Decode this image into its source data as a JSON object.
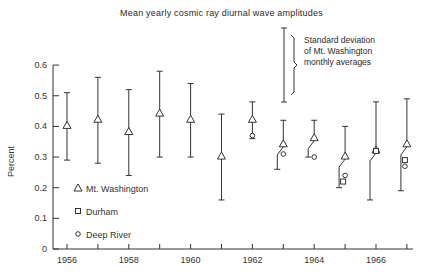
{
  "title": "Mean yearly cosmic ray diurnal wave amplitudes",
  "annotation": {
    "lines": [
      "Standard deviation",
      "of Mt. Washington",
      "monthly averages"
    ]
  },
  "legend": [
    {
      "marker": "triangle",
      "label": "Mt. Washington"
    },
    {
      "marker": "square",
      "label": "Durham"
    },
    {
      "marker": "circle",
      "label": "Deep River"
    }
  ],
  "chart_data": {
    "type": "scatter",
    "title": "Mean yearly cosmic ray diurnal wave amplitudes",
    "xlabel": "",
    "ylabel": "Percent",
    "xlim": [
      1955.6,
      1967.0
    ],
    "ylim": [
      0,
      0.6
    ],
    "x_ticks": [
      1956,
      1958,
      1960,
      1962,
      1964,
      1966
    ],
    "y_ticks": [
      0,
      0.1,
      0.2,
      0.3,
      0.4,
      0.5,
      0.6
    ],
    "y_tick_labels": [
      "0",
      "0.1",
      "0.2",
      "0.3",
      "0.4",
      "0.5",
      "0.6"
    ],
    "grid": false,
    "legend_position": "lower left inside",
    "series": [
      {
        "name": "Mt. Washington",
        "marker": "triangle",
        "points": [
          {
            "x": 1956,
            "y": 0.4,
            "low": 0.29,
            "high": 0.51
          },
          {
            "x": 1957,
            "y": 0.42,
            "low": 0.28,
            "high": 0.56
          },
          {
            "x": 1958,
            "y": 0.38,
            "low": 0.24,
            "high": 0.52
          },
          {
            "x": 1959,
            "y": 0.44,
            "low": 0.3,
            "high": 0.58
          },
          {
            "x": 1960,
            "y": 0.42,
            "low": 0.3,
            "high": 0.54
          },
          {
            "x": 1961,
            "y": 0.3,
            "low": 0.16,
            "high": 0.44
          },
          {
            "x": 1962,
            "y": 0.42,
            "low": 0.36,
            "high": 0.48
          },
          {
            "x": 1963,
            "y": 0.34,
            "low": 0.26,
            "high": 0.42
          },
          {
            "x": 1964,
            "y": 0.36,
            "low": 0.3,
            "high": 0.42
          },
          {
            "x": 1965,
            "y": 0.3,
            "low": 0.2,
            "high": 0.4
          },
          {
            "x": 1966,
            "y": 0.32,
            "low": 0.16,
            "high": 0.48
          },
          {
            "x": 1967,
            "y": 0.34,
            "low": 0.19,
            "high": 0.49
          }
        ]
      },
      {
        "name": "Durham",
        "marker": "square",
        "points": [
          {
            "x": 1965,
            "y": 0.22
          },
          {
            "x": 1966,
            "y": 0.32
          },
          {
            "x": 1967,
            "y": 0.29
          }
        ]
      },
      {
        "name": "Deep River",
        "marker": "circle",
        "points": [
          {
            "x": 1962,
            "y": 0.37
          },
          {
            "x": 1963,
            "y": 0.31
          },
          {
            "x": 1964,
            "y": 0.3
          },
          {
            "x": 1965,
            "y": 0.24
          },
          {
            "x": 1967,
            "y": 0.27
          }
        ]
      }
    ],
    "annotations": [
      {
        "text": "Standard deviation of Mt. Washington monthly averages",
        "target": "error bar example (0.48–0.69)"
      }
    ]
  }
}
